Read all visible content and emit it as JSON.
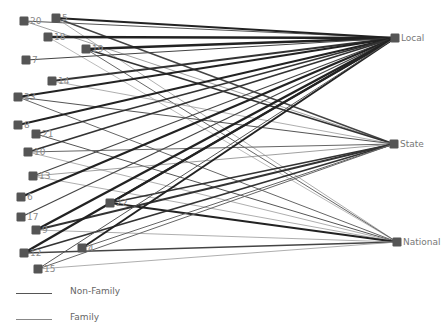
{
  "diagram": {
    "type": "bipartite-network",
    "colors": {
      "node": "#555555",
      "edge_strong": "#222222",
      "edge_medium": "#555555",
      "edge_light": "#999999",
      "label": "#888888"
    },
    "targets": [
      {
        "id": "Local",
        "label": "Local",
        "x": 395,
        "y": 38
      },
      {
        "id": "State",
        "label": "State",
        "x": 394,
        "y": 144
      },
      {
        "id": "National",
        "label": "National",
        "x": 397,
        "y": 242
      }
    ],
    "sources": [
      {
        "id": "20",
        "label": "20",
        "x": 24,
        "y": 21
      },
      {
        "id": "5",
        "label": "5",
        "x": 56,
        "y": 18
      },
      {
        "id": "18",
        "label": "18",
        "x": 48,
        "y": 37
      },
      {
        "id": "19",
        "label": "19",
        "x": 86,
        "y": 49
      },
      {
        "id": "7",
        "label": "7",
        "x": 26,
        "y": 60
      },
      {
        "id": "14",
        "label": "14",
        "x": 52,
        "y": 81
      },
      {
        "id": "23",
        "label": "23",
        "x": 18,
        "y": 97
      },
      {
        "id": "8",
        "label": "8",
        "x": 18,
        "y": 125
      },
      {
        "id": "21",
        "label": "21",
        "x": 36,
        "y": 134
      },
      {
        "id": "10",
        "label": "10",
        "x": 28,
        "y": 152
      },
      {
        "id": "13",
        "label": "13",
        "x": 33,
        "y": 176
      },
      {
        "id": "6",
        "label": "6",
        "x": 21,
        "y": 197
      },
      {
        "id": "17",
        "label": "17",
        "x": 21,
        "y": 217
      },
      {
        "id": "22",
        "label": "22",
        "x": 110,
        "y": 203
      },
      {
        "id": "9",
        "label": "9",
        "x": 36,
        "y": 230
      },
      {
        "id": "12",
        "label": "12",
        "x": 24,
        "y": 253
      },
      {
        "id": "4",
        "label": "4",
        "x": 82,
        "y": 248
      },
      {
        "id": "15",
        "label": "15",
        "x": 38,
        "y": 269
      }
    ],
    "edges": [
      {
        "from": "20",
        "to": "Local",
        "w": 1.2,
        "c": "#555555"
      },
      {
        "from": "20",
        "to": "State",
        "w": 0.8,
        "c": "#888888"
      },
      {
        "from": "5",
        "to": "Local",
        "w": 2.2,
        "c": "#222222"
      },
      {
        "from": "5",
        "to": "State",
        "w": 1.4,
        "c": "#444444"
      },
      {
        "from": "5",
        "to": "National",
        "w": 0.8,
        "c": "#999999"
      },
      {
        "from": "18",
        "to": "Local",
        "w": 2.6,
        "c": "#222222"
      },
      {
        "from": "18",
        "to": "National",
        "w": 0.8,
        "c": "#aaaaaa"
      },
      {
        "from": "19",
        "to": "Local",
        "w": 2.4,
        "c": "#222222"
      },
      {
        "from": "19",
        "to": "State",
        "w": 1.8,
        "c": "#333333"
      },
      {
        "from": "19",
        "to": "National",
        "w": 1.0,
        "c": "#666666"
      },
      {
        "from": "7",
        "to": "Local",
        "w": 1.2,
        "c": "#444444"
      },
      {
        "from": "14",
        "to": "Local",
        "w": 1.8,
        "c": "#333333"
      },
      {
        "from": "14",
        "to": "State",
        "w": 0.8,
        "c": "#999999"
      },
      {
        "from": "23",
        "to": "Local",
        "w": 2.0,
        "c": "#222222"
      },
      {
        "from": "23",
        "to": "State",
        "w": 1.2,
        "c": "#555555"
      },
      {
        "from": "23",
        "to": "National",
        "w": 1.0,
        "c": "#666666"
      },
      {
        "from": "8",
        "to": "Local",
        "w": 2.0,
        "c": "#222222"
      },
      {
        "from": "21",
        "to": "Local",
        "w": 1.8,
        "c": "#333333"
      },
      {
        "from": "21",
        "to": "National",
        "w": 1.0,
        "c": "#555555"
      },
      {
        "from": "10",
        "to": "Local",
        "w": 1.8,
        "c": "#333333"
      },
      {
        "from": "10",
        "to": "State",
        "w": 1.0,
        "c": "#666666"
      },
      {
        "from": "10",
        "to": "National",
        "w": 0.8,
        "c": "#999999"
      },
      {
        "from": "13",
        "to": "Local",
        "w": 1.2,
        "c": "#444444"
      },
      {
        "from": "13",
        "to": "State",
        "w": 0.8,
        "c": "#888888"
      },
      {
        "from": "13",
        "to": "National",
        "w": 0.8,
        "c": "#999999"
      },
      {
        "from": "6",
        "to": "Local",
        "w": 2.2,
        "c": "#222222"
      },
      {
        "from": "17",
        "to": "Local",
        "w": 1.2,
        "c": "#444444"
      },
      {
        "from": "22",
        "to": "Local",
        "w": 2.0,
        "c": "#222222"
      },
      {
        "from": "22",
        "to": "State",
        "w": 1.6,
        "c": "#333333"
      },
      {
        "from": "22",
        "to": "National",
        "w": 2.0,
        "c": "#222222"
      },
      {
        "from": "9",
        "to": "Local",
        "w": 2.4,
        "c": "#222222"
      },
      {
        "from": "9",
        "to": "State",
        "w": 1.8,
        "c": "#333333"
      },
      {
        "from": "9",
        "to": "National",
        "w": 0.8,
        "c": "#999999"
      },
      {
        "from": "12",
        "to": "Local",
        "w": 2.4,
        "c": "#222222"
      },
      {
        "from": "12",
        "to": "State",
        "w": 1.8,
        "c": "#333333"
      },
      {
        "from": "12",
        "to": "National",
        "w": 1.6,
        "c": "#444444"
      },
      {
        "from": "4",
        "to": "Local",
        "w": 2.0,
        "c": "#222222"
      },
      {
        "from": "4",
        "to": "State",
        "w": 1.0,
        "c": "#666666"
      },
      {
        "from": "15",
        "to": "Local",
        "w": 1.0,
        "c": "#555555"
      },
      {
        "from": "15",
        "to": "State",
        "w": 1.0,
        "c": "#666666"
      },
      {
        "from": "15",
        "to": "National",
        "w": 0.8,
        "c": "#999999"
      }
    ]
  },
  "legend": {
    "items": [
      {
        "label": "Non-Family",
        "color": "#555555"
      },
      {
        "label": "Family",
        "color": "#888888"
      }
    ]
  }
}
